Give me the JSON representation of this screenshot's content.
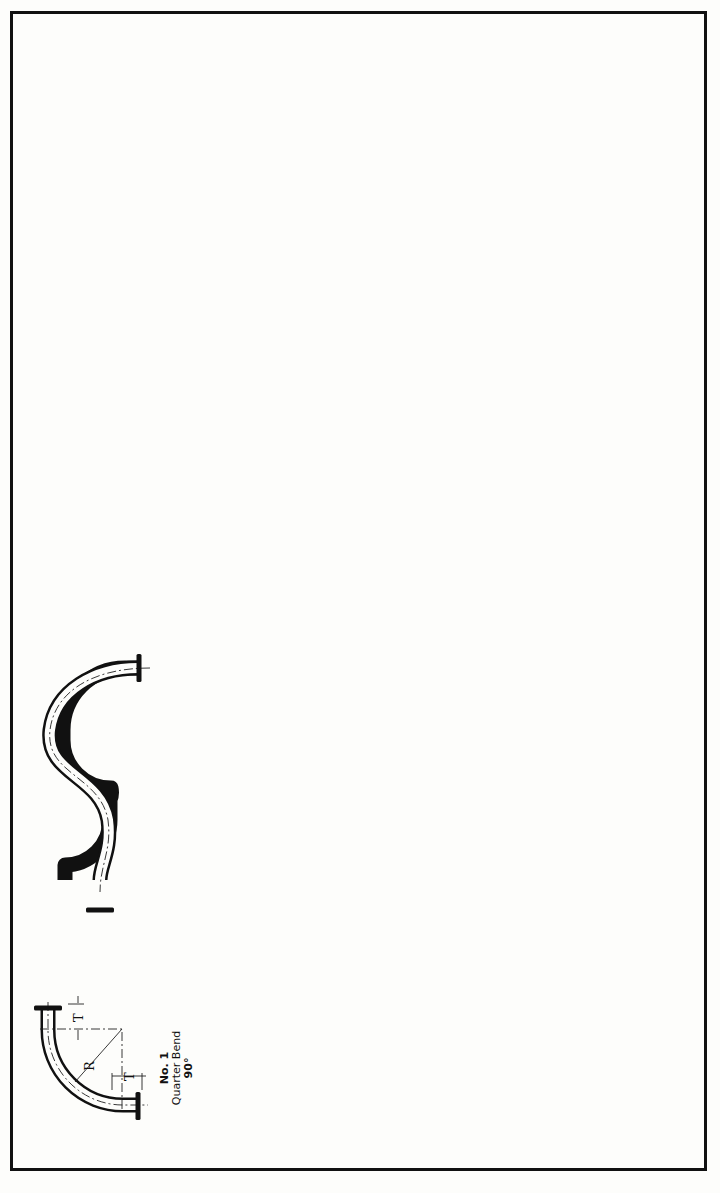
{
  "diagram": {
    "orientation": "rotated 90 degrees counter-clockwise",
    "dimension_symbols": {
      "radius": "R",
      "tangent": "T"
    },
    "bends": [
      {
        "id": "1",
        "number": "No. 1",
        "name": "Quarter Bend",
        "extra": "90°"
      },
      {
        "id": "2",
        "number": "No. 2",
        "name": "Single Offset Quarter Bend",
        "extra": ""
      },
      {
        "id": "4",
        "number": "No. 4",
        "name": "Crossover Bend",
        "extra": ""
      },
      {
        "id": "5",
        "number": "No. 5",
        "name": "Offset Bend",
        "extra": ""
      },
      {
        "id": "6",
        "number": "No. 6",
        "name": "Single Offset U-Bend",
        "extra": ""
      },
      {
        "id": "7",
        "number": "No. 7",
        "name": "U-Bend, 180°",
        "extra": ""
      },
      {
        "id": "7.5",
        "number": "No. 7½",
        "name": "Angle Bend",
        "extra": "91° to 179°"
      },
      {
        "id": "8",
        "number": "No. 8",
        "name": "Double Offset U-Bend",
        "extra": ""
      },
      {
        "id": "9",
        "number": "No. 9",
        "name": "Expansion U-Bend",
        "extra": ""
      },
      {
        "id": "10",
        "number": "No. 10",
        "name": "Double Offset Expansion U-Bend",
        "extra": ""
      },
      {
        "id": "11",
        "number": "No. 11",
        "name": "Circle Bend",
        "extra": ""
      }
    ]
  }
}
